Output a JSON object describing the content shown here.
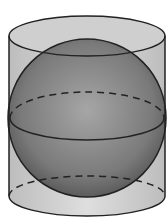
{
  "diagram": {
    "colors": {
      "background": "#ffffff",
      "cylinder_fill": "#d4d4d4",
      "sphere_light": "#9a9a9a",
      "sphere_dark": "#4a4a4a",
      "stroke": "#222222"
    }
  }
}
